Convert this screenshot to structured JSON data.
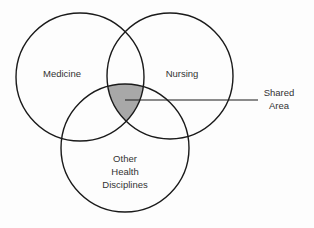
{
  "diagram": {
    "type": "venn",
    "circles": [
      {
        "id": "medicine",
        "label": "Medicine",
        "cx": 80,
        "cy": 77,
        "r": 64
      },
      {
        "id": "nursing",
        "label": "Nursing",
        "cx": 170,
        "cy": 76,
        "r": 63
      },
      {
        "id": "other",
        "label_lines": [
          "Other",
          "Health",
          "Disciplines"
        ],
        "cx": 125,
        "cy": 148,
        "r": 64
      }
    ],
    "shared_area": {
      "label_lines": [
        "Shared",
        "Area"
      ],
      "fill_color": "#a8a8a8"
    },
    "colors": {
      "stroke": "#1a1a1a",
      "background": "#fdfdfd",
      "text": "#333333"
    }
  }
}
